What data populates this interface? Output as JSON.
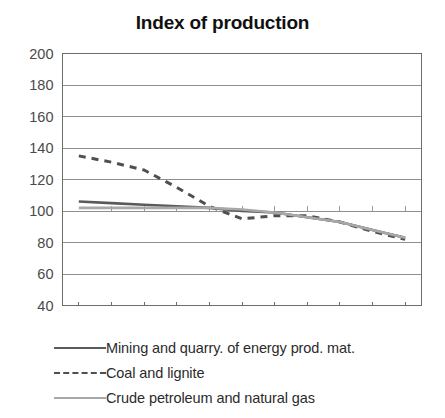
{
  "chart_data": {
    "type": "line",
    "title": "Index of production",
    "xlabel": "",
    "ylabel": "",
    "xlim": [
      1995.5,
      2006.5
    ],
    "ylim": [
      40,
      200
    ],
    "yticks": [
      40,
      60,
      80,
      100,
      120,
      140,
      160,
      180,
      200
    ],
    "xticks": [
      1996,
      1998,
      2000,
      2002,
      2004,
      2006
    ],
    "xtick_labels": [
      "1996",
      "1998",
      "2000",
      "2002",
      "2004",
      "2006"
    ],
    "ytick_labels": [
      "40",
      "60",
      "80",
      "100",
      "120",
      "140",
      "160",
      "180",
      "200"
    ],
    "grid": "horizontal",
    "legend_position": "below",
    "x": [
      1996,
      1997,
      1998,
      1999,
      2000,
      2001,
      2002,
      2003,
      2004,
      2005,
      2006
    ],
    "series": [
      {
        "name": "Mining and quarry. of energy prod. mat.",
        "style": "solid",
        "color": "#5a5a5a",
        "values": [
          106,
          105,
          104,
          103,
          102,
          100,
          99,
          96,
          93,
          88,
          83
        ]
      },
      {
        "name": "Coal and lignite",
        "style": "dashed",
        "color": "#4f4f4f",
        "values": [
          135,
          131,
          126,
          115,
          103,
          95,
          97,
          97,
          93,
          87,
          82
        ]
      },
      {
        "name": "Crude petroleum and natural gas",
        "style": "solid",
        "color": "#a8a8a8",
        "values": [
          102,
          102,
          102,
          102,
          102,
          101,
          99,
          96,
          93,
          88,
          83
        ]
      }
    ]
  },
  "legend": {
    "items": [
      {
        "label": "Mining and quarry. of energy prod. mat."
      },
      {
        "label": "Coal and lignite"
      },
      {
        "label": "Crude petroleum and natural gas"
      }
    ]
  },
  "colors": {
    "series_dark": "#5a5a5a",
    "series_dashed": "#4f4f4f",
    "series_light": "#a8a8a8",
    "grid": "#8f8f8f",
    "axis": "#6e6e6e",
    "text": "#3a3a3a",
    "background": "#ffffff"
  }
}
